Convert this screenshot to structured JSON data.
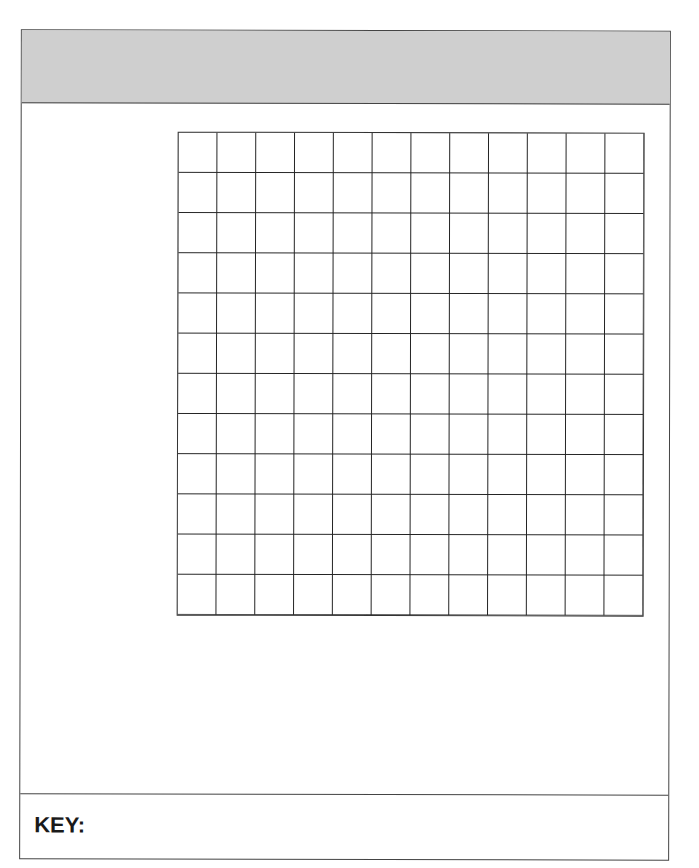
{
  "title_band": {
    "text": ""
  },
  "graph": {
    "columns": 12,
    "rows": 12
  },
  "key": {
    "label": "KEY:",
    "content": ""
  }
}
